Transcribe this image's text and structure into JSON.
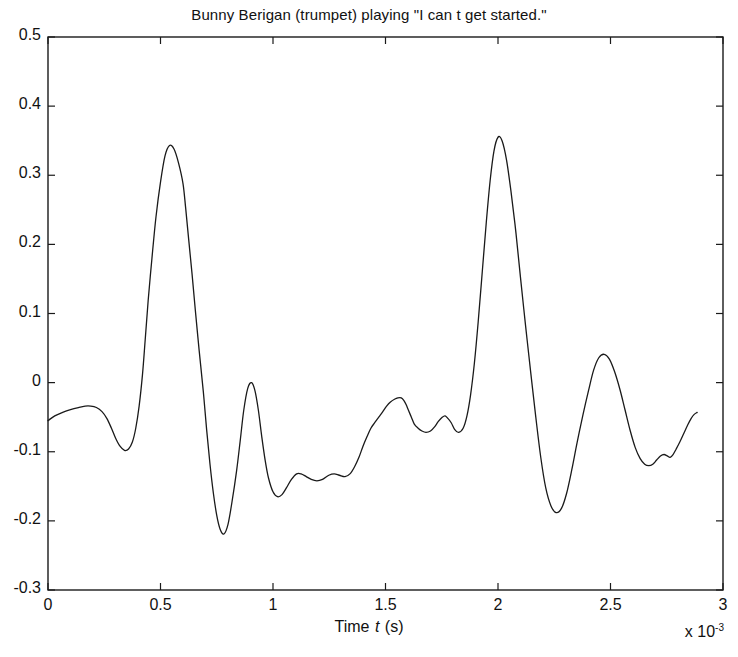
{
  "chart_data": {
    "type": "line",
    "title": "Bunny Berigan (trumpet) playing \"I can t get started.\"",
    "xlabel": "Time t (s)",
    "ylabel": "",
    "x_multiplier": "x 10-3",
    "x_multiplier_base": "x 10",
    "x_multiplier_exponent": "-3",
    "xlim": [
      0,
      3
    ],
    "ylim": [
      -0.3,
      0.5
    ],
    "xticks": [
      0,
      0.5,
      1,
      1.5,
      2,
      2.5,
      3
    ],
    "xtick_labels": [
      "0",
      "0.5",
      "1",
      "1.5",
      "2",
      "2.5",
      "3"
    ],
    "yticks": [
      -0.3,
      -0.2,
      -0.1,
      0,
      0.1,
      0.2,
      0.3,
      0.4,
      0.5
    ],
    "ytick_labels": [
      "-0.3",
      "-0.2",
      "-0.1",
      "0",
      "0.1",
      "0.2",
      "0.3",
      "0.4",
      "0.5"
    ],
    "grid": false,
    "legend": false,
    "line_color": "#1a1a1a",
    "line_width": 1.3,
    "series": [
      {
        "name": "waveform",
        "x": [
          0.0,
          0.03,
          0.065,
          0.1,
          0.135,
          0.165,
          0.19,
          0.215,
          0.24,
          0.262,
          0.282,
          0.3,
          0.32,
          0.34,
          0.358,
          0.375,
          0.39,
          0.405,
          0.42,
          0.432,
          0.445,
          0.462,
          0.48,
          0.5,
          0.52,
          0.54,
          0.56,
          0.58,
          0.6,
          0.612,
          0.625,
          0.64,
          0.655,
          0.672,
          0.69,
          0.705,
          0.72,
          0.735,
          0.75,
          0.765,
          0.782,
          0.8,
          0.818,
          0.838,
          0.855,
          0.87,
          0.888,
          0.905,
          0.92,
          0.935,
          0.95,
          0.965,
          0.98,
          1.0,
          1.02,
          1.04,
          1.06,
          1.082,
          1.105,
          1.125,
          1.148,
          1.17,
          1.195,
          1.22,
          1.248,
          1.272,
          1.295,
          1.32,
          1.342,
          1.362,
          1.382,
          1.4,
          1.418,
          1.435,
          1.452,
          1.47,
          1.488,
          1.505,
          1.522,
          1.54,
          1.555,
          1.57,
          1.582,
          1.592,
          1.602,
          1.615,
          1.628,
          1.645,
          1.662,
          1.68,
          1.7,
          1.718,
          1.735,
          1.752,
          1.765,
          1.778,
          1.792,
          1.808,
          1.825,
          1.845,
          1.862,
          1.878,
          1.895,
          1.912,
          1.93,
          1.948,
          1.965,
          1.982,
          2.0,
          2.018,
          2.038,
          2.058,
          2.08,
          2.1,
          2.122,
          2.145,
          2.168,
          2.19,
          2.212,
          2.235,
          2.258,
          2.282,
          2.305,
          2.328,
          2.352,
          2.378,
          2.402,
          2.425,
          2.448,
          2.472,
          2.495,
          2.518,
          2.542,
          2.565,
          2.588,
          2.61,
          2.632,
          2.652,
          2.67,
          2.688,
          2.705,
          2.722,
          2.738,
          2.752,
          2.765,
          2.778,
          2.792,
          2.808,
          2.825,
          2.842,
          2.858,
          2.872,
          2.885
        ],
        "y": [
          -0.055,
          -0.048,
          -0.043,
          -0.039,
          -0.036,
          -0.034,
          -0.034,
          -0.036,
          -0.042,
          -0.052,
          -0.066,
          -0.08,
          -0.092,
          -0.098,
          -0.096,
          -0.086,
          -0.066,
          -0.034,
          0.012,
          0.062,
          0.118,
          0.18,
          0.24,
          0.29,
          0.328,
          0.343,
          0.338,
          0.318,
          0.288,
          0.252,
          0.208,
          0.158,
          0.104,
          0.046,
          -0.012,
          -0.068,
          -0.118,
          -0.16,
          -0.192,
          -0.212,
          -0.219,
          -0.205,
          -0.172,
          -0.128,
          -0.082,
          -0.04,
          -0.008,
          0.0,
          -0.012,
          -0.04,
          -0.078,
          -0.112,
          -0.138,
          -0.158,
          -0.165,
          -0.162,
          -0.152,
          -0.14,
          -0.132,
          -0.132,
          -0.136,
          -0.14,
          -0.142,
          -0.14,
          -0.134,
          -0.132,
          -0.134,
          -0.136,
          -0.132,
          -0.122,
          -0.108,
          -0.092,
          -0.078,
          -0.066,
          -0.058,
          -0.05,
          -0.042,
          -0.034,
          -0.028,
          -0.024,
          -0.022,
          -0.022,
          -0.026,
          -0.032,
          -0.04,
          -0.05,
          -0.06,
          -0.066,
          -0.07,
          -0.072,
          -0.07,
          -0.064,
          -0.056,
          -0.05,
          -0.048,
          -0.052,
          -0.058,
          -0.068,
          -0.072,
          -0.066,
          -0.048,
          -0.018,
          0.028,
          0.088,
          0.16,
          0.232,
          0.292,
          0.335,
          0.355,
          0.35,
          0.322,
          0.276,
          0.216,
          0.152,
          0.084,
          0.016,
          -0.05,
          -0.108,
          -0.152,
          -0.178,
          -0.188,
          -0.182,
          -0.16,
          -0.126,
          -0.086,
          -0.046,
          -0.012,
          0.018,
          0.036,
          0.041,
          0.034,
          0.016,
          -0.01,
          -0.04,
          -0.07,
          -0.094,
          -0.11,
          -0.118,
          -0.12,
          -0.118,
          -0.112,
          -0.106,
          -0.104,
          -0.106,
          -0.108,
          -0.104,
          -0.096,
          -0.086,
          -0.074,
          -0.062,
          -0.052,
          -0.046,
          -0.043
        ]
      },
      {
        "name": "waveform-continued",
        "x": [
          2.885
        ],
        "y": [
          -0.043
        ]
      }
    ],
    "full_x": [
      0.0,
      0.03,
      0.065,
      0.1,
      0.135,
      0.165,
      0.19,
      0.215,
      0.24,
      0.262,
      0.282,
      0.3,
      0.32,
      0.34,
      0.358,
      0.375,
      0.39,
      0.405,
      0.42,
      0.432,
      0.445,
      0.462,
      0.48,
      0.5,
      0.52,
      0.54,
      0.56,
      0.58,
      0.6,
      0.612,
      0.625,
      0.64,
      0.655,
      0.672,
      0.69,
      0.705,
      0.72,
      0.735,
      0.75,
      0.765,
      0.782,
      0.8,
      0.818,
      0.838,
      0.855,
      0.87,
      0.888,
      0.905,
      0.92,
      0.935,
      0.95,
      0.965,
      0.98,
      1.0,
      1.02,
      1.04,
      1.06,
      1.082,
      1.105,
      1.125,
      1.148,
      1.17,
      1.195,
      1.22,
      1.248,
      1.272,
      1.295,
      1.32,
      1.342,
      1.362,
      1.382,
      1.4,
      1.418,
      1.435,
      1.452,
      1.47,
      1.488,
      1.505,
      1.522,
      1.54,
      1.555,
      1.57,
      1.582,
      1.592,
      1.602,
      1.615,
      1.628,
      1.645,
      1.662,
      1.68,
      1.7,
      1.718,
      1.735,
      1.752,
      1.765,
      1.778,
      1.792,
      1.808,
      1.825,
      1.845,
      1.862,
      1.878,
      1.895,
      1.912,
      1.93,
      1.948,
      1.965,
      1.982,
      2.0,
      2.018,
      2.038,
      2.058,
      2.08,
      2.1,
      2.122,
      2.145,
      2.168,
      2.19,
      2.212,
      2.235,
      2.258,
      2.282,
      2.305,
      2.328,
      2.352,
      2.378,
      2.402,
      2.425,
      2.448,
      2.472,
      2.495,
      2.518,
      2.542,
      2.565,
      2.588,
      2.61,
      2.632,
      2.652,
      2.67,
      2.688,
      2.705,
      2.722,
      2.738,
      2.752,
      2.765,
      2.778,
      2.792,
      2.808,
      2.825,
      2.842,
      2.858,
      2.872,
      2.885
    ],
    "full_y": [
      -0.055,
      -0.048,
      -0.043,
      -0.039,
      -0.036,
      -0.034,
      -0.034,
      -0.036,
      -0.042,
      -0.052,
      -0.066,
      -0.08,
      -0.092,
      -0.098,
      -0.096,
      -0.086,
      -0.066,
      -0.034,
      0.012,
      0.062,
      0.118,
      0.18,
      0.24,
      0.29,
      0.328,
      0.343,
      0.338,
      0.318,
      0.288,
      0.252,
      0.208,
      0.158,
      0.104,
      0.046,
      -0.012,
      -0.068,
      -0.118,
      -0.16,
      -0.192,
      -0.212,
      -0.219,
      -0.205,
      -0.172,
      -0.128,
      -0.082,
      -0.04,
      -0.008,
      0.0,
      -0.012,
      -0.04,
      -0.078,
      -0.112,
      -0.138,
      -0.158,
      -0.165,
      -0.162,
      -0.152,
      -0.14,
      -0.132,
      -0.132,
      -0.136,
      -0.14,
      -0.142,
      -0.14,
      -0.134,
      -0.132,
      -0.134,
      -0.136,
      -0.132,
      -0.122,
      -0.108,
      -0.092,
      -0.078,
      -0.066,
      -0.058,
      -0.05,
      -0.042,
      -0.034,
      -0.028,
      -0.024,
      -0.022,
      -0.022,
      -0.026,
      -0.032,
      -0.04,
      -0.05,
      -0.06,
      -0.066,
      -0.07,
      -0.072,
      -0.07,
      -0.064,
      -0.056,
      -0.05,
      -0.048,
      -0.052,
      -0.058,
      -0.068,
      -0.072,
      -0.066,
      -0.048,
      -0.018,
      0.028,
      0.088,
      0.16,
      0.232,
      0.292,
      0.335,
      0.355,
      0.35,
      0.322,
      0.276,
      0.216,
      0.152,
      0.084,
      0.016,
      -0.05,
      -0.108,
      -0.152,
      -0.178,
      -0.188,
      -0.182,
      -0.16,
      -0.126,
      -0.086,
      -0.046,
      -0.012,
      0.018,
      0.036,
      0.041,
      0.034,
      0.016,
      -0.01,
      -0.04,
      -0.07,
      -0.094,
      -0.11,
      -0.118,
      -0.12,
      -0.118,
      -0.112,
      -0.106,
      -0.104,
      -0.106,
      -0.108,
      -0.104,
      -0.096,
      -0.086,
      -0.074,
      -0.062,
      -0.052,
      -0.046,
      -0.043
    ],
    "annotations": {
      "peak_1": {
        "x": 0.54,
        "y": 0.343
      },
      "peak_2": {
        "x": 2.0,
        "y": 0.355
      },
      "peak_3": {
        "x": 2.752,
        "y": 0.403
      },
      "trough_1": {
        "x": 0.782,
        "y": -0.219
      },
      "trough_2": {
        "x": 2.258,
        "y": -0.188
      }
    },
    "data_end_x": 2.885
  },
  "axes": {
    "plot_left": 48,
    "plot_right": 723,
    "plot_top": 37,
    "plot_bottom": 590
  }
}
